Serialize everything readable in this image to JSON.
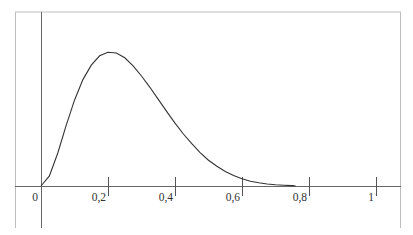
{
  "chart_data": {
    "type": "line",
    "title": "",
    "xlabel": "",
    "ylabel": "",
    "xlim": [
      0,
      1
    ],
    "grid": false,
    "legend": null,
    "x_ticks": [
      {
        "value": 0,
        "label": "0"
      },
      {
        "value": 0.2,
        "label": "0,2"
      },
      {
        "value": 0.4,
        "label": "0,4"
      },
      {
        "value": 0.6,
        "label": "0,6"
      },
      {
        "value": 0.8,
        "label": "0,8"
      },
      {
        "value": 1,
        "label": "1"
      }
    ],
    "series": [
      {
        "name": "density",
        "description": "Unimodal right-skewed density curve (Beta(3,9)-like), peak near x=0.2, approaching 0 near x=0.75",
        "x": [
          0,
          0.025,
          0.05,
          0.075,
          0.1,
          0.125,
          0.15,
          0.175,
          0.2,
          0.225,
          0.25,
          0.275,
          0.3,
          0.325,
          0.35,
          0.375,
          0.4,
          0.425,
          0.45,
          0.475,
          0.5,
          0.525,
          0.55,
          0.575,
          0.6,
          0.625,
          0.65,
          0.675,
          0.7,
          0.725,
          0.75
        ],
        "values": [
          0,
          0.25,
          0.82,
          1.5,
          2.13,
          2.64,
          3.0,
          3.23,
          3.32,
          3.3,
          3.18,
          2.98,
          2.73,
          2.45,
          2.15,
          1.85,
          1.56,
          1.29,
          1.05,
          0.83,
          0.64,
          0.49,
          0.36,
          0.26,
          0.18,
          0.12,
          0.08,
          0.05,
          0.03,
          0.02,
          0.01
        ]
      }
    ],
    "colors": {
      "curve": "#333333",
      "axis": "#555555",
      "frame": "#bbbbbb"
    }
  }
}
